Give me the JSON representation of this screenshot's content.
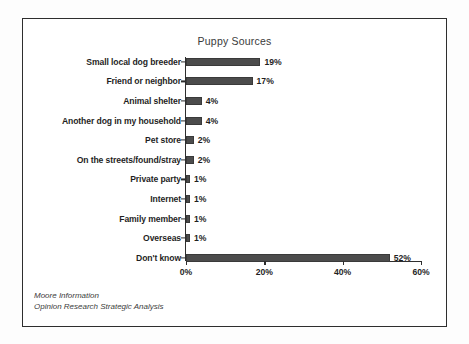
{
  "chart_data": {
    "type": "bar",
    "orientation": "horizontal",
    "title": "Puppy Sources",
    "xlabel": "",
    "ylabel": "",
    "xlim": [
      0,
      60
    ],
    "grid": false,
    "legend": false,
    "categories": [
      "Small local dog breeder",
      "Friend or neighbor",
      "Animal shelter",
      "Another dog in my household",
      "Pet store",
      "On the streets/found/stray",
      "Private party",
      "Internet",
      "Family member",
      "Overseas",
      "Don't know"
    ],
    "values": [
      19,
      17,
      4,
      4,
      2,
      2,
      1,
      1,
      1,
      1,
      52
    ],
    "value_labels": [
      "19%",
      "17%",
      "4%",
      "4%",
      "2%",
      "2%",
      "1%",
      "1%",
      "1%",
      "1%",
      "52%"
    ],
    "xticks": [
      0,
      20,
      40,
      60
    ],
    "xtick_labels": [
      "0%",
      "20%",
      "40%",
      "60%"
    ],
    "bar_color": "#4c4c4c",
    "axis_color": "#2e2e2e"
  },
  "source_note": {
    "line1": "Moore Information",
    "line2": "Opinion Research Strategic Analysis"
  }
}
